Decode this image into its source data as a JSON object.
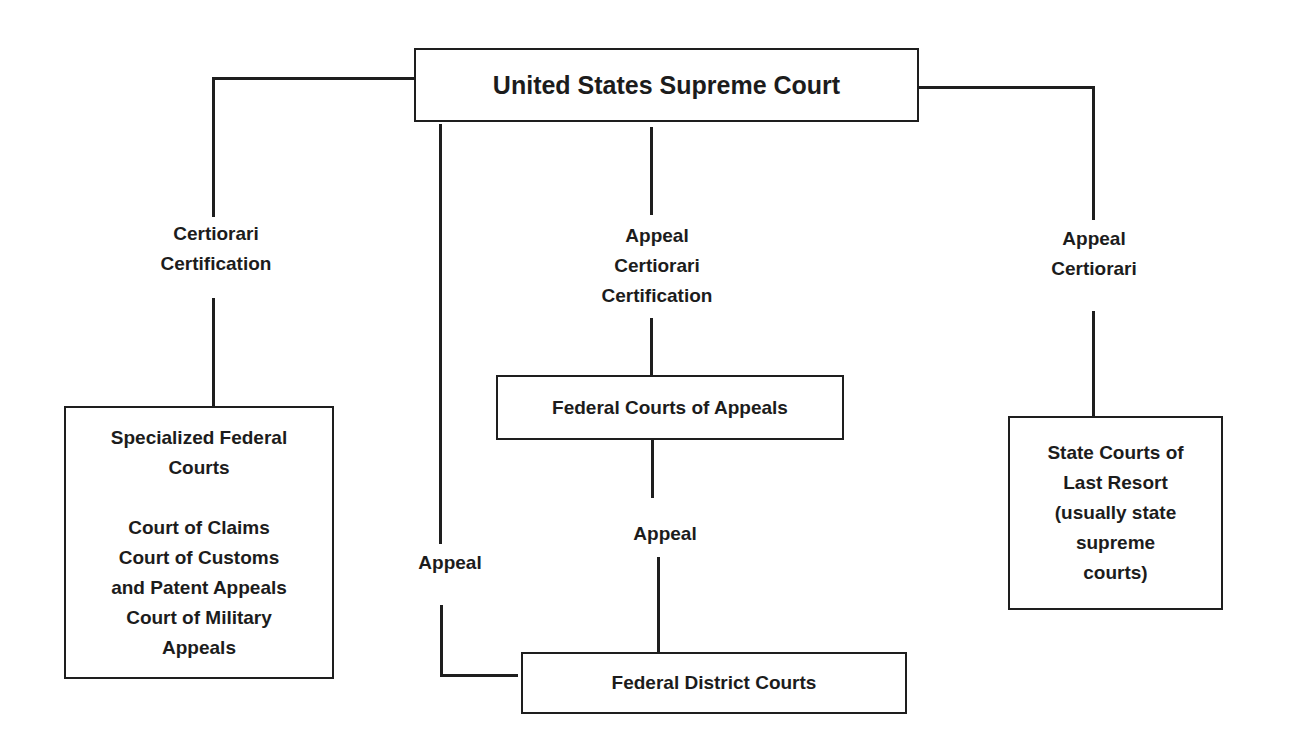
{
  "diagram": {
    "type": "hierarchy",
    "title": "United States Supreme Court",
    "nodes": {
      "supreme_court": {
        "label": "United States Supreme Court"
      },
      "specialized_courts": {
        "heading": [
          "Specialized Federal",
          "Courts"
        ],
        "members": [
          "Court of Claims",
          "Court of Customs",
          "and Patent Appeals",
          "Court of Military",
          "Appeals"
        ]
      },
      "courts_of_appeals": {
        "label": "Federal Courts of Appeals"
      },
      "state_courts": {
        "lines": [
          "State Courts of",
          "Last Resort",
          "(usually state",
          "supreme",
          "courts)"
        ]
      },
      "district_courts": {
        "label": "Federal District Courts"
      }
    },
    "edges": {
      "specialized_to_supreme": {
        "lines": [
          "Certiorari",
          "Certification"
        ]
      },
      "appeals_to_supreme": {
        "lines": [
          "Appeal",
          "Certiorari",
          "Certification"
        ]
      },
      "state_to_supreme": {
        "lines": [
          "Appeal",
          "Certiorari"
        ]
      },
      "district_to_supreme": {
        "label": "Appeal"
      },
      "district_to_appeals": {
        "label": "Appeal"
      }
    },
    "colors": {
      "line": "#1e1e1e",
      "text": "#1c1c1c",
      "background": "#ffffff"
    }
  }
}
